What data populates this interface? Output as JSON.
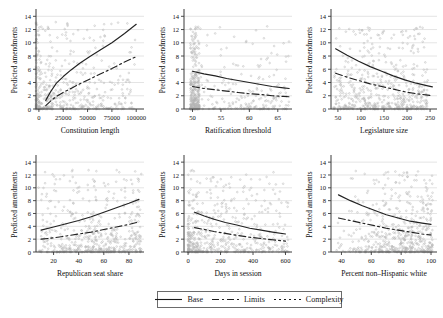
{
  "figure": {
    "background": "#ffffff",
    "width": 443,
    "height": 318,
    "axis_color": "#3a3a3a",
    "grid_color": "#d9d9d9",
    "point_color": "#b3b3b3",
    "line_color": "#222222"
  },
  "legend": {
    "position": "bottom-center",
    "items": [
      {
        "label": "Base",
        "style": "solid",
        "dash": "none"
      },
      {
        "label": "Limits",
        "style": "dash-dot",
        "dash": "7,3,2,3"
      },
      {
        "label": "Complexity",
        "style": "dotted",
        "dash": "2,3"
      }
    ]
  },
  "shared": {
    "ylabel": "Predicted amendments",
    "yticks": [
      0,
      2,
      4,
      6,
      8,
      10,
      12,
      14
    ],
    "ylim": [
      0,
      14.8
    ]
  },
  "chart_data": [
    {
      "type": "scatter",
      "panel": 1,
      "title": "",
      "xlabel": "Constitution length",
      "ylabel": "Predicted amendments",
      "xticks": [
        0,
        25000,
        50000,
        75000,
        100000
      ],
      "xticklabels": [
        "0",
        "25000",
        "50000",
        "75000",
        "100000"
      ],
      "yticks": [
        0,
        2,
        4,
        6,
        8,
        10,
        12,
        14
      ],
      "xlim": [
        -3000,
        108000
      ],
      "ylim": [
        0,
        14.8
      ],
      "grid": true,
      "legend": false,
      "series": [
        {
          "name": "Base",
          "style": "solid",
          "x": [
            7000,
            12000,
            18000,
            25000,
            33000,
            42000,
            52000,
            63000,
            75000,
            88000,
            100000
          ],
          "y": [
            1.3,
            2.6,
            3.9,
            4.9,
            5.9,
            6.9,
            7.9,
            8.9,
            10.0,
            11.4,
            12.8
          ]
        },
        {
          "name": "Limits",
          "style": "dash-dot",
          "x": [
            7000,
            12000,
            18000,
            25000,
            33000,
            42000,
            52000,
            63000,
            75000,
            88000,
            100000
          ],
          "y": [
            0.5,
            1.2,
            1.9,
            2.5,
            3.1,
            3.8,
            4.5,
            5.3,
            6.1,
            7.1,
            7.9
          ]
        }
      ],
      "points": {
        "n": 520,
        "x_concentration": "0-30000",
        "y_concentration": "0-3"
      }
    },
    {
      "type": "scatter",
      "panel": 2,
      "title": "",
      "xlabel": "Ratification threshold",
      "ylabel": "Predicted amendments",
      "xticks": [
        50,
        55,
        60,
        65
      ],
      "xticklabels": [
        "50",
        "55",
        "60",
        "65"
      ],
      "yticks": [
        0,
        2,
        4,
        6,
        8,
        10,
        12,
        14
      ],
      "xlim": [
        48.5,
        67.5
      ],
      "ylim": [
        0,
        14.8
      ],
      "grid": true,
      "legend": false,
      "series": [
        {
          "name": "Base",
          "style": "solid",
          "x": [
            50,
            52,
            54,
            56,
            58,
            60,
            62,
            64,
            66,
            67
          ],
          "y": [
            5.7,
            5.3,
            5.0,
            4.6,
            4.3,
            4.0,
            3.7,
            3.4,
            3.2,
            3.1
          ]
        },
        {
          "name": "Limits",
          "style": "dash-dot",
          "x": [
            50,
            52,
            54,
            56,
            58,
            60,
            62,
            64,
            66,
            67
          ],
          "y": [
            3.4,
            3.1,
            2.9,
            2.7,
            2.5,
            2.3,
            2.2,
            2.0,
            1.9,
            1.85
          ]
        }
      ],
      "points": {
        "n": 520,
        "x_concentration": "50-51",
        "y_concentration": "0-5"
      }
    },
    {
      "type": "scatter",
      "panel": 3,
      "title": "",
      "xlabel": "Legislature size",
      "ylabel": "Predicted amendments",
      "xticks": [
        50,
        100,
        150,
        200,
        250
      ],
      "xticklabels": [
        "50",
        "100",
        "150",
        "200",
        "250"
      ],
      "yticks": [
        0,
        2,
        4,
        6,
        8,
        10,
        12,
        14
      ],
      "xlim": [
        35,
        265
      ],
      "ylim": [
        0,
        14.8
      ],
      "grid": true,
      "legend": false,
      "series": [
        {
          "name": "Base",
          "style": "solid",
          "x": [
            45,
            70,
            95,
            120,
            145,
            170,
            195,
            220,
            245,
            255
          ],
          "y": [
            9.1,
            8.1,
            7.2,
            6.4,
            5.7,
            5.0,
            4.4,
            3.9,
            3.5,
            3.35
          ]
        },
        {
          "name": "Limits",
          "style": "dash-dot",
          "x": [
            45,
            70,
            95,
            120,
            145,
            170,
            195,
            220,
            245,
            255
          ],
          "y": [
            5.4,
            4.8,
            4.3,
            3.8,
            3.4,
            3.0,
            2.6,
            2.3,
            2.1,
            2.0
          ]
        }
      ],
      "points": {
        "n": 540,
        "x_concentration": "50-200",
        "y_concentration": "0-3"
      }
    },
    {
      "type": "scatter",
      "panel": 4,
      "title": "",
      "xlabel": "Republican seat share",
      "ylabel": "Predicted amendments",
      "xticks": [
        20,
        40,
        60,
        80
      ],
      "xticklabels": [
        "20",
        "40",
        "60",
        "80"
      ],
      "yticks": [
        0,
        2,
        4,
        6,
        8,
        10,
        12,
        14
      ],
      "xlim": [
        6,
        92
      ],
      "ylim": [
        0,
        14.8
      ],
      "grid": true,
      "legend": false,
      "series": [
        {
          "name": "Base",
          "style": "solid",
          "x": [
            10,
            20,
            30,
            40,
            50,
            60,
            70,
            80,
            88
          ],
          "y": [
            3.4,
            3.9,
            4.4,
            4.9,
            5.5,
            6.2,
            6.9,
            7.6,
            8.2
          ]
        },
        {
          "name": "Limits",
          "style": "dash-dot",
          "x": [
            10,
            20,
            30,
            40,
            50,
            60,
            70,
            80,
            88
          ],
          "y": [
            2.0,
            2.2,
            2.5,
            2.8,
            3.1,
            3.5,
            3.9,
            4.3,
            4.7
          ]
        }
      ],
      "points": {
        "n": 540,
        "x_concentration": "20-80",
        "y_concentration": "0-3"
      }
    },
    {
      "type": "scatter",
      "panel": 5,
      "title": "",
      "xlabel": "Days in session",
      "ylabel": "Predicted amendments",
      "xticks": [
        0,
        200,
        400,
        600
      ],
      "xticklabels": [
        "0",
        "200",
        "400",
        "600"
      ],
      "yticks": [
        0,
        2,
        4,
        6,
        8,
        10,
        12,
        14
      ],
      "xlim": [
        -25,
        640
      ],
      "ylim": [
        0,
        14.8
      ],
      "grid": true,
      "legend": false,
      "series": [
        {
          "name": "Base",
          "style": "solid",
          "x": [
            40,
            100,
            160,
            230,
            300,
            380,
            450,
            520,
            600
          ],
          "y": [
            6.2,
            5.6,
            5.1,
            4.6,
            4.2,
            3.7,
            3.4,
            3.1,
            2.8
          ]
        },
        {
          "name": "Limits",
          "style": "dash-dot",
          "x": [
            40,
            100,
            160,
            230,
            300,
            380,
            450,
            520,
            600
          ],
          "y": [
            3.8,
            3.5,
            3.2,
            2.9,
            2.6,
            2.3,
            2.1,
            1.9,
            1.7
          ]
        }
      ],
      "points": {
        "n": 540,
        "x_concentration": "50-250",
        "y_concentration": "0-4"
      }
    },
    {
      "type": "scatter",
      "panel": 6,
      "title": "",
      "xlabel": "Percent non–Hispanic white",
      "ylabel": "Predicted amendments",
      "xticks": [
        40,
        60,
        80,
        100
      ],
      "xticklabels": [
        "40",
        "60",
        "80",
        "100"
      ],
      "yticks": [
        0,
        2,
        4,
        6,
        8,
        10,
        12,
        14
      ],
      "xlim": [
        33,
        104
      ],
      "ylim": [
        0,
        14.8
      ],
      "grid": true,
      "legend": false,
      "series": [
        {
          "name": "Base",
          "style": "solid",
          "x": [
            38,
            46,
            54,
            62,
            70,
            78,
            86,
            94,
            100
          ],
          "y": [
            8.9,
            8.0,
            7.2,
            6.5,
            5.8,
            5.3,
            4.8,
            4.5,
            4.3
          ]
        },
        {
          "name": "Limits",
          "style": "dash-dot",
          "x": [
            38,
            46,
            54,
            62,
            70,
            78,
            86,
            94,
            100
          ],
          "y": [
            5.3,
            4.9,
            4.5,
            4.1,
            3.7,
            3.4,
            3.1,
            2.8,
            2.65
          ]
        }
      ],
      "points": {
        "n": 540,
        "x_concentration": "60-100",
        "y_concentration": "0-3"
      }
    }
  ]
}
